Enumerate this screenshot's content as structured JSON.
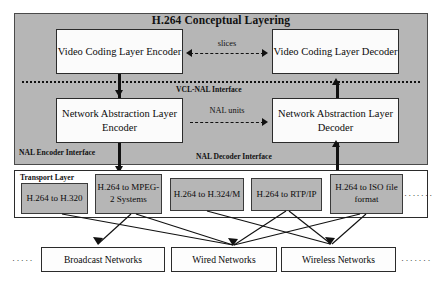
{
  "diagram": {
    "title": "H.264 Conceptual Layering",
    "interfaces": {
      "vcl_nal": "VCL-NAL Interface",
      "nal_encoder": "NAL Encoder Interface",
      "nal_decoder": "NAL Decoder Interface"
    },
    "layer_boxes": [
      {
        "id": "vcl-enc",
        "label": "Video Coding Layer Encoder"
      },
      {
        "id": "vcl-dec",
        "label": "Video Coding Layer Decoder"
      },
      {
        "id": "nal-enc",
        "label": "Network Abstraction Layer Encoder"
      },
      {
        "id": "nal-dec",
        "label": "Network Abstraction Layer Decoder"
      }
    ],
    "flow_labels": {
      "slices": "slices",
      "nal_units": "NAL units"
    },
    "transport": {
      "title": "Transport Layer",
      "mappings": [
        {
          "label": "H.264 to H.320"
        },
        {
          "label": "H.264 to MPEG-2 Systems"
        },
        {
          "label": "H.264 to H.324/M"
        },
        {
          "label": "H.264 to RTP/IP"
        },
        {
          "label": "H.264 to ISO file format"
        }
      ],
      "ellipsis": "·······"
    },
    "networks": {
      "items": [
        {
          "label": "Broadcast Networks"
        },
        {
          "label": "Wired Networks"
        },
        {
          "label": "Wireless Networks"
        }
      ],
      "ellipsis_left": "·····",
      "ellipsis_right": "·······"
    },
    "colors": {
      "panel_gray": "#b6b6b6",
      "box_white": "#fbfbfb",
      "stroke": "#2b2b2b",
      "background": "#ffffff"
    }
  }
}
